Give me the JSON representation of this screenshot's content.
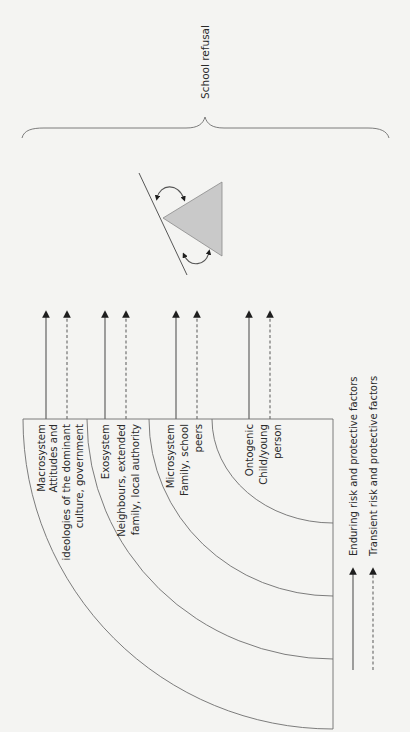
{
  "figure": {
    "orientation": "rotated-90-ccw",
    "outcome_label": "School refusal",
    "systems": [
      {
        "id": "macrosystem",
        "name": "Macrosystem",
        "lines": [
          "Macrosystem",
          "Attitudes and",
          "ideologies of the dominant",
          "culture, government"
        ]
      },
      {
        "id": "exosystem",
        "name": "Exosystem",
        "lines": [
          "Exosystem",
          "Neighbours, extended",
          "family, local authority"
        ]
      },
      {
        "id": "microsystem",
        "name": "Microsystem",
        "lines": [
          "Microsystem",
          "Family, school",
          "peers"
        ]
      },
      {
        "id": "ontogenic",
        "name": "Ontogenic",
        "lines": [
          "Ontogenic",
          "Child/young",
          "person"
        ]
      }
    ],
    "legend": {
      "enduring": "Enduring risk and protective factors",
      "transient": "Transient risk and protective factors"
    },
    "colors": {
      "background": "#f4f4f2",
      "line": "#6e6e6e",
      "triangle_fill": "#c9c9c9",
      "arrowhead": "#1e1e1e",
      "text": "#2a2a2a"
    }
  }
}
